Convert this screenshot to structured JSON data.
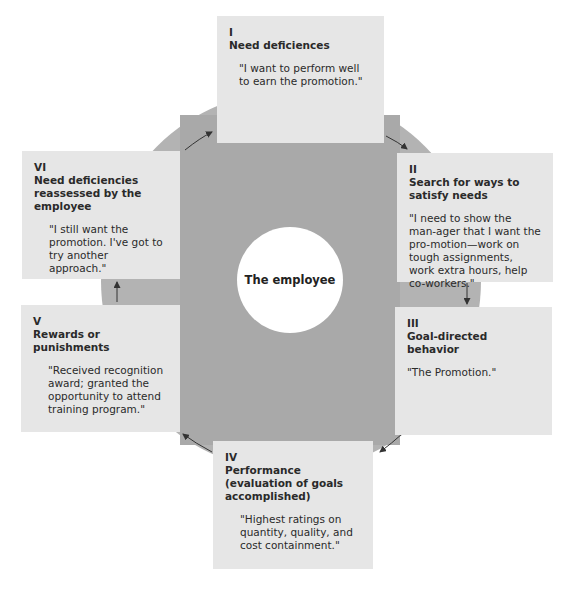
{
  "diagram": {
    "center_label": "The employee",
    "stages": [
      {
        "numeral": "I",
        "title": "Need deficiences",
        "quote": "\"I want to perform well to earn the promotion.\""
      },
      {
        "numeral": "II",
        "title": "Search for ways to satisfy needs",
        "quote": "\"I need to show the man-ager that I want the pro-motion—work on tough assignments, work extra hours, help co-workers.\""
      },
      {
        "numeral": "III",
        "title": "Goal-directed behavior",
        "quote": "\"The Promotion.\""
      },
      {
        "numeral": "IV",
        "title": "Performance (evaluation of goals accomplished)",
        "quote": "\"Highest ratings on quantity, quality, and cost containment.\""
      },
      {
        "numeral": "V",
        "title": "Rewards or punishments",
        "quote": "\"Received recognition award; granted the opportunity to attend training program.\""
      },
      {
        "numeral": "VI",
        "title": "Need deficiencies reassessed by the employee",
        "quote": "\"I still want the promotion. I've got to try another approach.\""
      }
    ],
    "colors": {
      "ring": "#b3b3b3",
      "inner": "#a9a9a9",
      "box": "#e6e6e6",
      "hub": "#ffffff",
      "text": "#2a2a2a"
    }
  }
}
